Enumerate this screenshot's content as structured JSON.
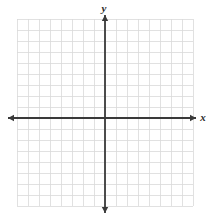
{
  "figure": {
    "type": "coordinate-plane",
    "title": "",
    "background_color": "#ffffff"
  },
  "axes": {
    "x_axis": {
      "label": "x",
      "label_x": 203,
      "label_y": 121,
      "line_y": 118,
      "start_x": 8,
      "end_x": 196,
      "arrow_left": true,
      "arrow_right": true,
      "color": "#3a3a3a",
      "width": 1.8
    },
    "y_axis": {
      "label": "y",
      "label_x": 104,
      "label_y": 12,
      "line_x": 105,
      "start_y": 15,
      "end_y": 213,
      "arrow_up": true,
      "arrow_down": true,
      "color": "#3a3a3a",
      "width": 1.8
    }
  },
  "grid": {
    "color": "#d9d9d9",
    "width": 0.8,
    "left": 17,
    "top": 19,
    "right": 193,
    "bottom": 206,
    "cell_size": 11,
    "columns": 16,
    "rows": 17,
    "origin_column_index": 8,
    "origin_row_index": 9,
    "show_tick_labels": false,
    "show_numbers": false
  },
  "chart_data": {
    "type": "scatter",
    "title": "",
    "xlabel": "x",
    "ylabel": "y",
    "xlim": [
      -8,
      8
    ],
    "ylim": [
      -8,
      9
    ],
    "xticks": [],
    "yticks": [],
    "tick_labels_visible": false,
    "grid": true,
    "legend": null,
    "series": [],
    "annotations": []
  }
}
